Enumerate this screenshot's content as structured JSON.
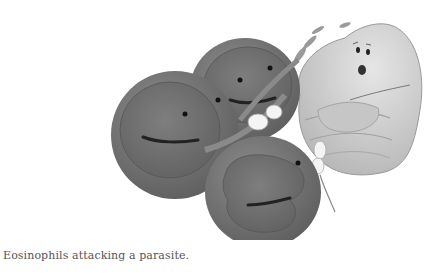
{
  "figure": {
    "caption": "Eosinophils attacking a parasite.",
    "alt": "Grayscale cartoon illustration of three round eosinophil cells with faces grabbing and pulling on a frightened worm-like parasite with gloved hands",
    "colors": {
      "cell_outer": "#7a7a7a",
      "cell_inner": "#6a6a6a",
      "cell_rim": "#9a9a9a",
      "parasite_body": "#d4d4d4",
      "parasite_shade": "#b8b8b8",
      "glove": "#f4f4f4",
      "background": "#ffffff",
      "caption_text": "#555555"
    },
    "characters": [
      {
        "name": "eosinophil-left",
        "expression": "smiling"
      },
      {
        "name": "eosinophil-top",
        "expression": "smiling"
      },
      {
        "name": "eosinophil-bottom",
        "expression": "smiling"
      },
      {
        "name": "parasite-worm",
        "expression": "scared"
      }
    ]
  }
}
